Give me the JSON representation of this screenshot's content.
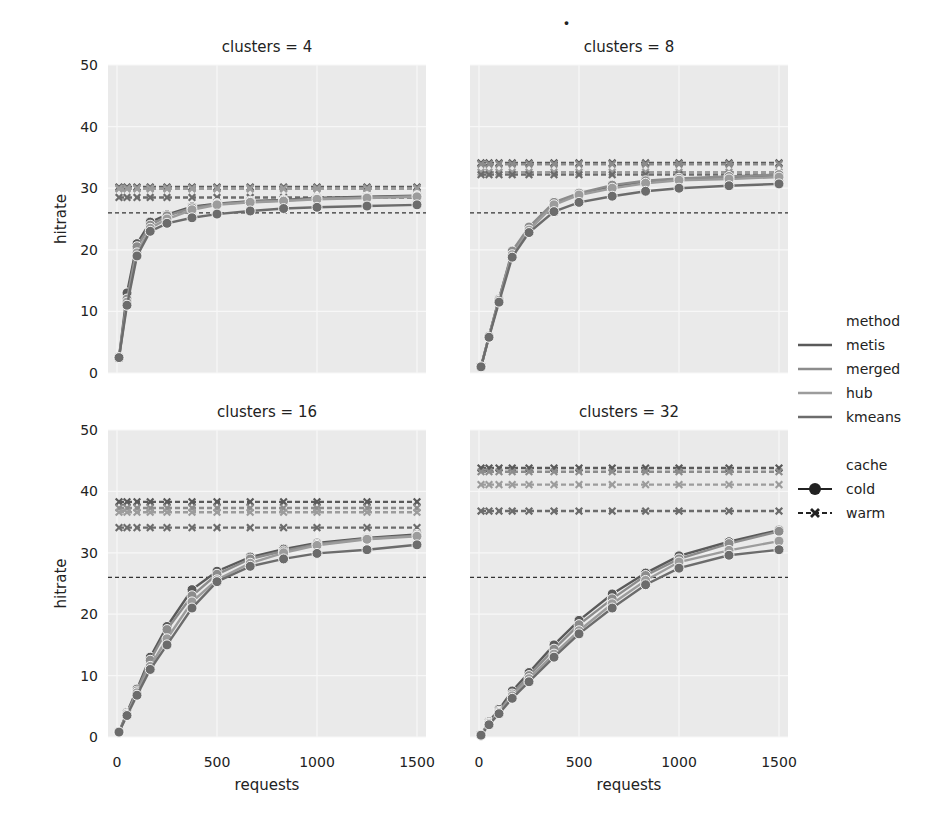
{
  "chart_data": {
    "type": "line",
    "layout": "facet-grid 2x2",
    "xlabel": "requests",
    "ylabel": "hitrate",
    "xlim": [
      0,
      1500
    ],
    "ylim": [
      0,
      50
    ],
    "xticks": [
      0,
      500,
      1000,
      1500
    ],
    "yticks": [
      0,
      10,
      20,
      30,
      40,
      50
    ],
    "grid": true,
    "legend_position": "right",
    "x": [
      10,
      50,
      100,
      166,
      250,
      375,
      500,
      666,
      833,
      1000,
      1250,
      1500
    ],
    "baseline": 26,
    "legend": {
      "method_title": "method",
      "methods": [
        "metis",
        "merged",
        "hub",
        "kmeans"
      ],
      "cache_title": "cache",
      "caches": [
        "cold",
        "warm"
      ]
    },
    "panels": [
      {
        "title": "clusters = 4",
        "series": [
          {
            "method": "metis",
            "cache": "cold",
            "values": [
              2.5,
              13,
              21,
              24.5,
              25.7,
              27,
              27.5,
              27.9,
              28.1,
              28.4,
              28.6,
              28.8
            ]
          },
          {
            "method": "merged",
            "cache": "cold",
            "values": [
              2.5,
              12,
              20.5,
              24,
              25.5,
              26.8,
              27.4,
              27.8,
              28,
              28.3,
              28.5,
              28.7
            ]
          },
          {
            "method": "hub",
            "cache": "cold",
            "values": [
              2.5,
              11.5,
              19.5,
              23.5,
              25,
              26.5,
              27.3,
              27.7,
              27.9,
              28.2,
              28.4,
              28.6
            ]
          },
          {
            "method": "kmeans",
            "cache": "cold",
            "values": [
              2.5,
              11,
              19,
              23,
              24.3,
              25.2,
              25.8,
              26.3,
              26.7,
              26.9,
              27.1,
              27.3
            ]
          },
          {
            "method": "metis",
            "cache": "warm",
            "values": [
              30.2,
              30.2,
              30.2,
              30.2,
              30.2,
              30.2,
              30.2,
              30.2,
              30.2,
              30.2,
              30.2,
              30.2
            ]
          },
          {
            "method": "merged",
            "cache": "warm",
            "values": [
              30,
              30,
              30,
              30,
              30,
              30,
              30,
              30,
              30,
              30,
              30,
              30
            ]
          },
          {
            "method": "hub",
            "cache": "warm",
            "values": [
              29.9,
              29.9,
              29.9,
              29.9,
              29.9,
              29.9,
              29.9,
              29.9,
              29.9,
              29.9,
              29.9,
              29.9
            ]
          },
          {
            "method": "kmeans",
            "cache": "warm",
            "values": [
              28.5,
              28.5,
              28.5,
              28.5,
              28.5,
              28.5,
              28.5,
              28.5,
              28.5,
              28.5,
              28.5,
              28.5
            ]
          }
        ]
      },
      {
        "title": "clusters = 8",
        "series": [
          {
            "method": "metis",
            "cache": "cold",
            "values": [
              1,
              6,
              12,
              19.5,
              23.5,
              27.5,
              29,
              30.3,
              31,
              31.5,
              31.8,
              32.1
            ]
          },
          {
            "method": "merged",
            "cache": "cold",
            "values": [
              1,
              6,
              12,
              19.8,
              23.7,
              27.7,
              29.2,
              30.5,
              31.2,
              31.6,
              31.9,
              32.2
            ]
          },
          {
            "method": "hub",
            "cache": "cold",
            "values": [
              1,
              6,
              11.8,
              19.2,
              23.2,
              27.3,
              28.9,
              30,
              30.8,
              31.3,
              31.5,
              31.8
            ]
          },
          {
            "method": "kmeans",
            "cache": "cold",
            "values": [
              1,
              5.8,
              11.5,
              18.8,
              22.8,
              26.2,
              27.7,
              28.7,
              29.5,
              30,
              30.4,
              30.7
            ]
          },
          {
            "method": "metis",
            "cache": "warm",
            "values": [
              34.1,
              34.1,
              34.1,
              34.1,
              34.1,
              34.1,
              34.1,
              34.1,
              34.1,
              34.1,
              34.1,
              34.1
            ]
          },
          {
            "method": "merged",
            "cache": "warm",
            "values": [
              33.9,
              33.9,
              33.9,
              33.9,
              33.9,
              33.9,
              33.9,
              33.9,
              33.9,
              33.9,
              33.9,
              33.9
            ]
          },
          {
            "method": "hub",
            "cache": "warm",
            "values": [
              32.6,
              32.6,
              32.6,
              32.6,
              32.6,
              32.6,
              32.6,
              32.6,
              32.6,
              32.6,
              32.6,
              32.6
            ]
          },
          {
            "method": "kmeans",
            "cache": "warm",
            "values": [
              32.2,
              32.2,
              32.2,
              32.2,
              32.2,
              32.2,
              32.2,
              32.2,
              32.2,
              32.2,
              32.2,
              32.2
            ]
          }
        ]
      },
      {
        "title": "clusters = 16",
        "series": [
          {
            "method": "metis",
            "cache": "cold",
            "values": [
              0.8,
              4,
              7.8,
              13,
              18,
              24,
              27,
              29.3,
              30.6,
              31.6,
              32.4,
              33
            ]
          },
          {
            "method": "merged",
            "cache": "cold",
            "values": [
              0.8,
              3.8,
              7.5,
              12.5,
              17.5,
              23,
              26.5,
              29,
              30.3,
              31.4,
              32.3,
              32.8
            ]
          },
          {
            "method": "hub",
            "cache": "cold",
            "values": [
              0.8,
              3.7,
              7.2,
              11.5,
              16,
              22,
              25.6,
              28.3,
              30,
              31.2,
              32.2,
              32.7
            ]
          },
          {
            "method": "kmeans",
            "cache": "cold",
            "values": [
              0.8,
              3.5,
              6.8,
              11,
              15,
              21,
              25.3,
              27.8,
              29,
              29.9,
              30.5,
              31.3
            ]
          },
          {
            "method": "metis",
            "cache": "warm",
            "values": [
              38.3,
              38.3,
              38.3,
              38.3,
              38.3,
              38.3,
              38.3,
              38.3,
              38.3,
              38.3,
              38.3,
              38.3
            ]
          },
          {
            "method": "merged",
            "cache": "warm",
            "values": [
              37.3,
              37.3,
              37.3,
              37.3,
              37.3,
              37.3,
              37.3,
              37.3,
              37.3,
              37.3,
              37.3,
              37.3
            ]
          },
          {
            "method": "hub",
            "cache": "warm",
            "values": [
              36.6,
              36.6,
              36.6,
              36.6,
              36.6,
              36.6,
              36.6,
              36.6,
              36.6,
              36.6,
              36.6,
              36.6
            ]
          },
          {
            "method": "kmeans",
            "cache": "warm",
            "values": [
              34.1,
              34.1,
              34.1,
              34.1,
              34.1,
              34.1,
              34.1,
              34.1,
              34.1,
              34.1,
              34.1,
              34.1
            ]
          }
        ]
      },
      {
        "title": "clusters = 32",
        "series": [
          {
            "method": "metis",
            "cache": "cold",
            "values": [
              0.3,
              2.5,
              4.5,
              7.5,
              10.5,
              15,
              19,
              23.3,
              26.7,
              29.5,
              31.8,
              33.7
            ]
          },
          {
            "method": "merged",
            "cache": "cold",
            "values": [
              0.3,
              2.3,
              4.2,
              7,
              10,
              14.3,
              18.3,
              22.5,
              26.3,
              29,
              31.5,
              33.5
            ]
          },
          {
            "method": "hub",
            "cache": "cold",
            "values": [
              0.3,
              2.2,
              4,
              6.7,
              9.5,
              13.5,
              17.3,
              21.7,
              25.5,
              28.5,
              30.4,
              31.9
            ]
          },
          {
            "method": "kmeans",
            "cache": "cold",
            "values": [
              0.3,
              2,
              3.8,
              6.3,
              9,
              13,
              16.8,
              21,
              24.8,
              27.5,
              29.6,
              30.5
            ]
          },
          {
            "method": "metis",
            "cache": "warm",
            "values": [
              43.8,
              43.8,
              43.8,
              43.8,
              43.8,
              43.8,
              43.8,
              43.8,
              43.8,
              43.8,
              43.8,
              43.8
            ]
          },
          {
            "method": "merged",
            "cache": "warm",
            "values": [
              43.2,
              43.2,
              43.2,
              43.2,
              43.2,
              43.2,
              43.2,
              43.2,
              43.2,
              43.2,
              43.2,
              43.2
            ]
          },
          {
            "method": "hub",
            "cache": "warm",
            "values": [
              41.1,
              41.1,
              41.1,
              41.1,
              41.1,
              41.1,
              41.1,
              41.1,
              41.1,
              41.1,
              41.1,
              41.1
            ]
          },
          {
            "method": "kmeans",
            "cache": "warm",
            "values": [
              36.8,
              36.8,
              36.8,
              36.8,
              36.8,
              36.8,
              36.8,
              36.8,
              36.8,
              36.8,
              36.8,
              36.8
            ]
          }
        ]
      }
    ]
  },
  "colors": {
    "metis": "#5a5a5a",
    "merged": "#8c8c8c",
    "hub": "#9c9c9c",
    "kmeans": "#6c6c6c",
    "panel_bg": "#eaeaea",
    "grid": "#f7f7f7",
    "baseline": "#333333"
  },
  "top_fragment": "."
}
